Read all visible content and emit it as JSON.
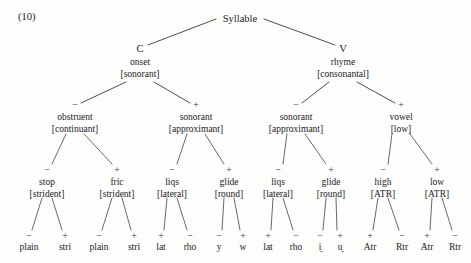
{
  "example_number": "(10)",
  "colors": {
    "background": "#fdfdfc",
    "ink": "#23221f",
    "line": "#3b3a37"
  },
  "tree": {
    "root": {
      "name": "root-node",
      "category": "Syllable",
      "x": 240,
      "y": 22
    },
    "level2": [
      {
        "name": "node-c",
        "category": "C",
        "label": "onset",
        "feature": "[sonorant]",
        "x": 140,
        "y": 52,
        "sign": ""
      },
      {
        "name": "node-v",
        "category": "V",
        "label": "rhyme",
        "feature": "[consonantal]",
        "x": 343,
        "y": 52,
        "sign": ""
      }
    ],
    "level3": [
      {
        "name": "node-obstruent",
        "label": "obstruent",
        "feature": "[continuant]",
        "x": 75,
        "y": 120,
        "sign": "−",
        "sign_x": 75,
        "sign_y": 108,
        "parent_x": 140,
        "parent_y": 52
      },
      {
        "name": "node-sonorant-onset",
        "label": "sonorant",
        "feature": "[approximant]",
        "x": 196,
        "y": 120,
        "sign": "+",
        "sign_x": 196,
        "sign_y": 108,
        "parent_x": 140,
        "parent_y": 52
      },
      {
        "name": "node-sonorant-rhyme",
        "label": "sonorant",
        "feature": "[approximant]",
        "x": 296,
        "y": 120,
        "sign": "−",
        "sign_x": 296,
        "sign_y": 108,
        "parent_x": 343,
        "parent_y": 52
      },
      {
        "name": "node-vowel",
        "label": "vowel",
        "feature": "[low]",
        "x": 401,
        "y": 120,
        "sign": "+",
        "sign_x": 401,
        "sign_y": 108,
        "parent_x": 343,
        "parent_y": 52
      }
    ],
    "level4": [
      {
        "name": "node-stop",
        "label": "stop",
        "feature": "[strident]",
        "x": 47,
        "y": 185,
        "sign": "−",
        "parent_x": 75,
        "parent_y": 128
      },
      {
        "name": "node-fric",
        "label": "fric",
        "feature": "[strident]",
        "x": 117,
        "y": 185,
        "sign": "+",
        "parent_x": 75,
        "parent_y": 128
      },
      {
        "name": "node-liqs-onset",
        "label": "liqs",
        "feature": "[lateral]",
        "x": 172,
        "y": 185,
        "sign": "−",
        "parent_x": 196,
        "parent_y": 128
      },
      {
        "name": "node-glide-onset",
        "label": "glide",
        "feature": "[round]",
        "x": 229,
        "y": 185,
        "sign": "+",
        "parent_x": 196,
        "parent_y": 128
      },
      {
        "name": "node-liqs-rhyme",
        "label": "liqs",
        "feature": "[lateral]",
        "x": 278,
        "y": 185,
        "sign": "−",
        "parent_x": 296,
        "parent_y": 128
      },
      {
        "name": "node-glide-rhyme",
        "label": "glide",
        "feature": "[round]",
        "x": 331,
        "y": 185,
        "sign": "+",
        "parent_x": 296,
        "parent_y": 128
      },
      {
        "name": "node-high",
        "label": "high",
        "feature": "[ATR]",
        "x": 383,
        "y": 185,
        "sign": "−",
        "parent_x": 401,
        "parent_y": 128
      },
      {
        "name": "node-low",
        "label": "low",
        "feature": "[ATR]",
        "x": 437,
        "y": 185,
        "sign": "+",
        "parent_x": 401,
        "parent_y": 128
      }
    ],
    "leaves": [
      {
        "name": "leaf-plain-stop",
        "label": "plain",
        "diacritic": "",
        "x": 29,
        "y": 250,
        "sign": "−",
        "parent_x": 47,
        "parent_y": 193
      },
      {
        "name": "leaf-stri-stop",
        "label": "stri",
        "diacritic": "",
        "x": 65,
        "y": 250,
        "sign": "+",
        "parent_x": 47,
        "parent_y": 193
      },
      {
        "name": "leaf-plain-fric",
        "label": "plain",
        "diacritic": "",
        "x": 99,
        "y": 250,
        "sign": "−",
        "parent_x": 117,
        "parent_y": 193
      },
      {
        "name": "leaf-stri-fric",
        "label": "stri",
        "diacritic": "",
        "x": 134,
        "y": 250,
        "sign": "+",
        "parent_x": 117,
        "parent_y": 193
      },
      {
        "name": "leaf-lat-onset",
        "label": "lat",
        "diacritic": "",
        "x": 161,
        "y": 250,
        "sign": "+",
        "parent_x": 172,
        "parent_y": 193
      },
      {
        "name": "leaf-rho-onset",
        "label": "rho",
        "diacritic": "",
        "x": 190,
        "y": 250,
        "sign": "−",
        "parent_x": 172,
        "parent_y": 193
      },
      {
        "name": "leaf-y",
        "label": "y",
        "diacritic": "",
        "x": 219,
        "y": 250,
        "sign": "−",
        "parent_x": 229,
        "parent_y": 193
      },
      {
        "name": "leaf-w",
        "label": "w",
        "diacritic": "",
        "x": 243,
        "y": 250,
        "sign": "+",
        "parent_x": 229,
        "parent_y": 193
      },
      {
        "name": "leaf-lat-rhyme",
        "label": "lat",
        "diacritic": "",
        "x": 268,
        "y": 250,
        "sign": "+",
        "parent_x": 278,
        "parent_y": 193
      },
      {
        "name": "leaf-rho-rhyme",
        "label": "rho",
        "diacritic": "",
        "x": 296,
        "y": 250,
        "sign": "−",
        "parent_x": 278,
        "parent_y": 193
      },
      {
        "name": "leaf-i-nonsyllabic",
        "label": "i",
        "diacritic": "̯",
        "x": 320,
        "y": 250,
        "sign": "−",
        "parent_x": 331,
        "parent_y": 193
      },
      {
        "name": "leaf-u-nonsyllabic",
        "label": "u",
        "diacritic": "̯",
        "x": 340,
        "y": 250,
        "sign": "+",
        "parent_x": 331,
        "parent_y": 193
      },
      {
        "name": "leaf-atr-high",
        "label": "Atr",
        "diacritic": "",
        "x": 370,
        "y": 250,
        "sign": "+",
        "parent_x": 383,
        "parent_y": 193
      },
      {
        "name": "leaf-rtr-high",
        "label": "Rtr",
        "diacritic": "",
        "x": 402,
        "y": 250,
        "sign": "−",
        "parent_x": 383,
        "parent_y": 193
      },
      {
        "name": "leaf-atr-low",
        "label": "Atr",
        "diacritic": "",
        "x": 427,
        "y": 250,
        "sign": "+",
        "parent_x": 437,
        "parent_y": 193
      },
      {
        "name": "leaf-rtr-low",
        "label": "Rtr",
        "diacritic": "",
        "x": 455,
        "y": 250,
        "sign": "−",
        "parent_x": 437,
        "parent_y": 193
      }
    ]
  }
}
